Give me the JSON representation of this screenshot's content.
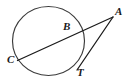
{
  "figure": {
    "type": "geometry-diagram",
    "width": 132,
    "height": 83,
    "background_color": "#ffffff",
    "stroke_color": "#1a1a1a",
    "circle_stroke_color": "#3a3a3a",
    "labels": {
      "a": "A",
      "b": "B",
      "c": "C",
      "t": "T"
    },
    "circle": {
      "center_x": 48.5,
      "center_y": 41.0,
      "radius_x": 36.0,
      "radius_y": 34.5,
      "stroke_width": 1.15
    },
    "points": {
      "A": {
        "x": 113.0,
        "y": 17.0
      },
      "B": {
        "x": 76.0,
        "y": 31.0
      },
      "C": {
        "x": 17.5,
        "y": 60.5
      },
      "T": {
        "x": 77.0,
        "y": 70.0
      }
    },
    "segments": [
      {
        "name": "secant-CA",
        "from": "C",
        "to": "A",
        "stroke_width": 1.3
      },
      {
        "name": "tangent-TA",
        "from": "T",
        "to": "A",
        "stroke_width": 1.3
      }
    ]
  }
}
